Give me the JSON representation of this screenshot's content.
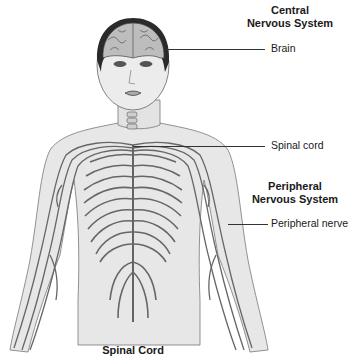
{
  "diagram": {
    "title": "Nervous System",
    "headers": {
      "central_line1": "Central",
      "central_line2": "Nervous System",
      "peripheral_line1": "Peripheral",
      "peripheral_line2": "Nervous System"
    },
    "labels": {
      "brain": "Brain",
      "spinal_cord": "Spinal cord",
      "peripheral_nerve": "Peripheral nerve"
    },
    "caption": "Spinal Cord",
    "colors": {
      "skin": "#e6e6e6",
      "outline": "#555555",
      "nerve": "#6b6b6b",
      "hair": "#2a2a2a",
      "brain": "#bdbdbd"
    }
  }
}
